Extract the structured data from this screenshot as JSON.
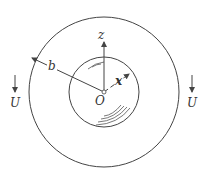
{
  "diagram": {
    "labels": {
      "z_axis": "z",
      "x_axis": "x",
      "origin": "O",
      "radius": "b",
      "flow_left": "U",
      "flow_right": "U"
    },
    "colors": {
      "stroke": "#444444",
      "background": "#ffffff"
    }
  }
}
